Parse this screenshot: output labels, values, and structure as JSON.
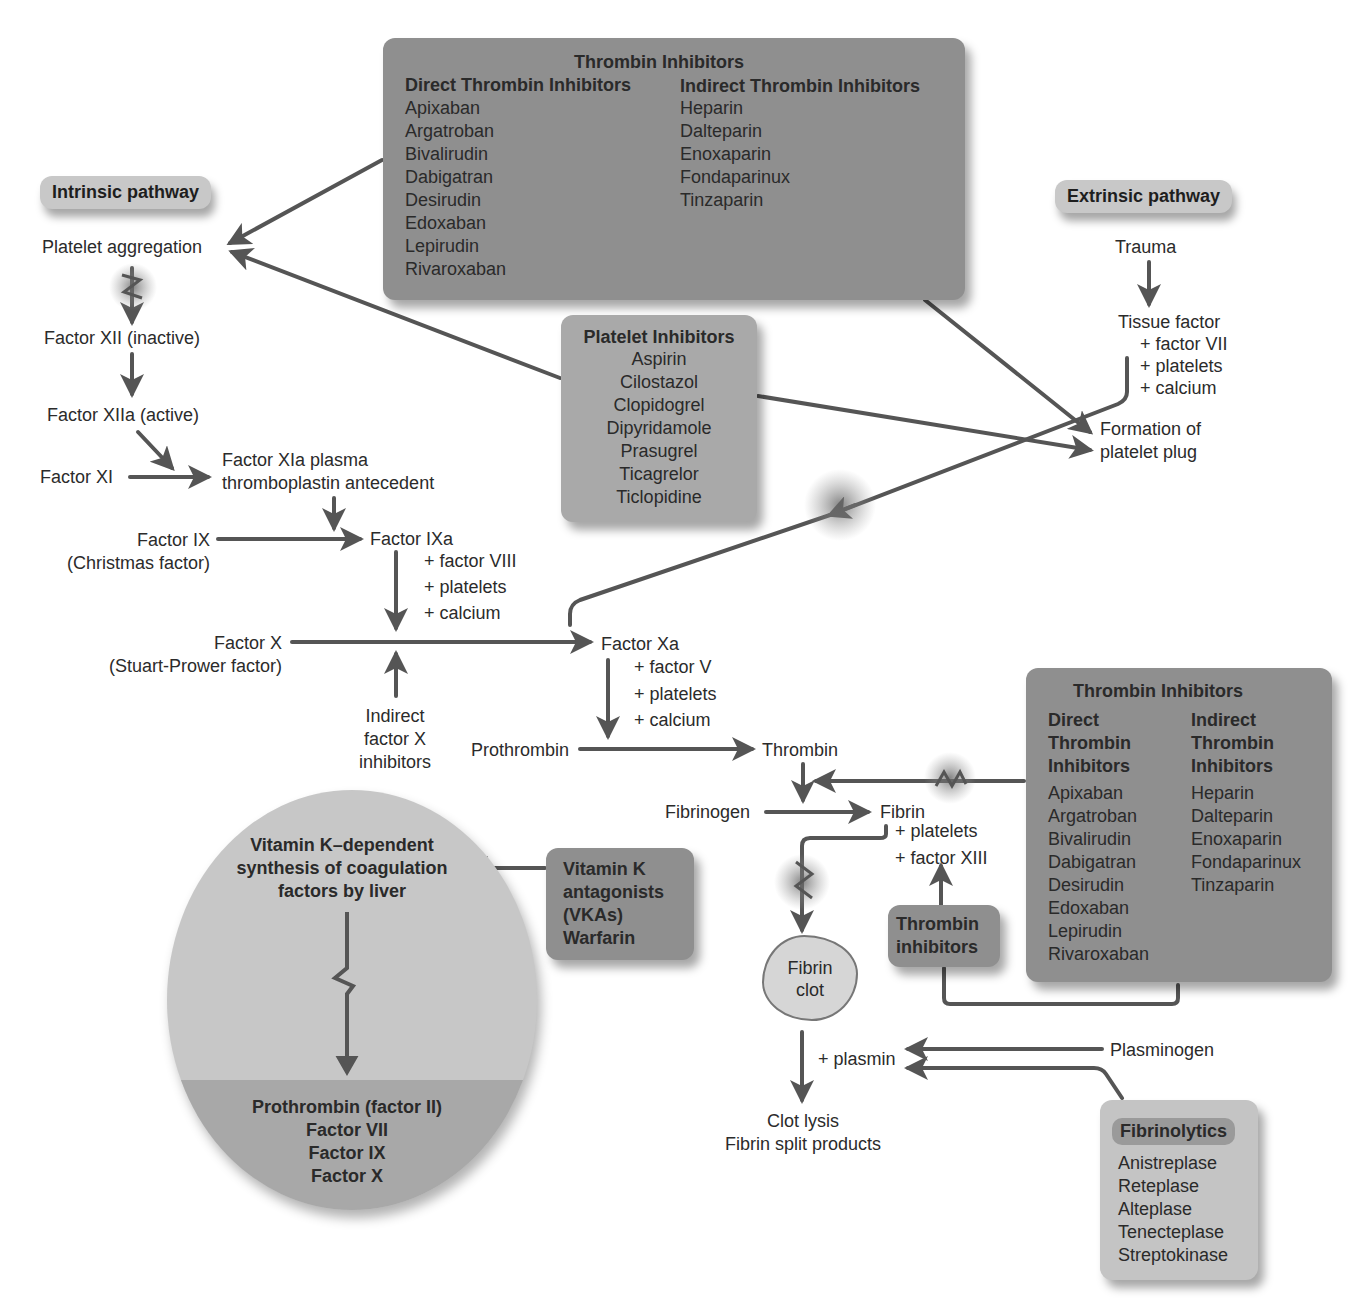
{
  "pathways": {
    "intrinsic_label": "Intrinsic pathway",
    "extrinsic_label": "Extrinsic pathway"
  },
  "intrinsic": {
    "platelet_aggregation": "Platelet aggregation",
    "factor_xii": "Factor XII (inactive)",
    "factor_xiia": "Factor XIIa (active)",
    "factor_xi": "Factor XI",
    "factor_xia_line1": "Factor XIa plasma",
    "factor_xia_line2": "thromboplastin antecedent",
    "factor_ix": "Factor IX",
    "factor_ix_alias": "(Christmas factor)",
    "factor_ixa": "Factor IXa",
    "ixa_cofactors": [
      "+ factor VIII",
      "+ platelets",
      "+ calcium"
    ],
    "factor_x": "Factor X",
    "factor_x_alias": "(Stuart-Prower factor)",
    "indirect_x_inhibitors": [
      "Indirect",
      "factor X",
      "inhibitors"
    ]
  },
  "extrinsic": {
    "trauma": "Trauma",
    "tissue_factor": "Tissue factor",
    "tf_cofactors": [
      "+ factor VII",
      "+ platelets",
      "+ calcium"
    ],
    "platelet_plug_line1": "Formation of",
    "platelet_plug_line2": "platelet plug"
  },
  "common": {
    "factor_xa": "Factor Xa",
    "xa_cofactors": [
      "+ factor V",
      "+ platelets",
      "+ calcium"
    ],
    "prothrombin": "Prothrombin",
    "thrombin": "Thrombin",
    "fibrinogen": "Fibrinogen",
    "fibrin": "Fibrin",
    "fibrin_cofactors": [
      "+ platelets",
      "+ factor XIII"
    ],
    "fibrin_clot_line1": "Fibrin",
    "fibrin_clot_line2": "clot",
    "plasmin": "+ plasmin",
    "plasminogen": "Plasminogen",
    "clot_lysis_line1": "Clot lysis",
    "clot_lysis_line2": "Fibrin split products"
  },
  "thrombin_box_top": {
    "title": "Thrombin Inhibitors",
    "direct_header": "Direct Thrombin Inhibitors",
    "indirect_header": "Indirect Thrombin Inhibitors",
    "direct": [
      "Apixaban",
      "Argatroban",
      "Bivalirudin",
      "Dabigatran",
      "Desirudin",
      "Edoxaban",
      "Lepirudin",
      "Rivaroxaban"
    ],
    "indirect": [
      "Heparin",
      "Dalteparin",
      "Enoxaparin",
      "Fondaparinux",
      "Tinzaparin"
    ]
  },
  "platelet_inhibitors": {
    "title": "Platelet Inhibitors",
    "items": [
      "Aspirin",
      "Cilostazol",
      "Clopidogrel",
      "Dipyridamole",
      "Prasugrel",
      "Ticagrelor",
      "Ticlopidine"
    ]
  },
  "thrombin_box_right": {
    "title": "Thrombin Inhibitors",
    "direct_header": [
      "Direct",
      "Thrombin",
      "Inhibitors"
    ],
    "indirect_header": [
      "Indirect",
      "Thrombin",
      "Inhibitors"
    ],
    "direct": [
      "Apixaban",
      "Argatroban",
      "Bivalirudin",
      "Dabigatran",
      "Desirudin",
      "Edoxaban",
      "Lepirudin",
      "Rivaroxaban"
    ],
    "indirect": [
      "Heparin",
      "Dalteparin",
      "Enoxaparin",
      "Fondaparinux",
      "Tinzaparin"
    ]
  },
  "thrombin_small": {
    "lines": [
      "Thrombin",
      "inhibitors"
    ]
  },
  "vka": {
    "lines": [
      "Vitamin K",
      "antagonists",
      "(VKAs)",
      "Warfarin"
    ]
  },
  "liver": {
    "top_lines": [
      "Vitamin K–dependent",
      "synthesis of coagulation",
      "factors by liver"
    ],
    "bottom_lines": [
      "Prothrombin (factor II)",
      "Factor VII",
      "Factor IX",
      "Factor X"
    ]
  },
  "fibrinolytics": {
    "title": "Fibrinolytics",
    "items": [
      "Anistreplase",
      "Reteplase",
      "Alteplase",
      "Tenecteplase",
      "Streptokinase"
    ]
  },
  "colors": {
    "arrow": "#555555",
    "box_dark": "#8f8f8f",
    "box_mid": "#a9a9a9",
    "box_light": "#c4c4c4"
  }
}
